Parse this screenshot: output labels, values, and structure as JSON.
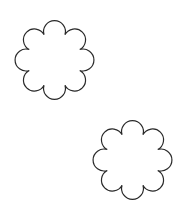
{
  "canvas": {
    "width": 183,
    "height": 213,
    "background": "#ffffff"
  },
  "shapes": [
    {
      "name": "scalloped-flower-top-left",
      "cx": 54.5,
      "cy": 60,
      "outer_radius": 40.5,
      "lobes": 8,
      "rotation_deg": 0,
      "stroke": "#2a2a2a",
      "fill": "#ffffff",
      "stroke_width": 1.2
    },
    {
      "name": "scalloped-flower-bottom-right",
      "cx": 132.5,
      "cy": 160,
      "outer_radius": 40.5,
      "lobes": 8,
      "rotation_deg": 0,
      "stroke": "#2a2a2a",
      "fill": "#ffffff",
      "stroke_width": 1.2
    }
  ]
}
